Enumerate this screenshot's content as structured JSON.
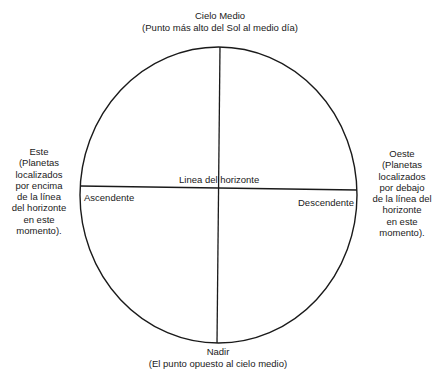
{
  "diagram": {
    "top": {
      "title": "Cielo Medio",
      "subtitle": "(Punto más alto del Sol al medio día)"
    },
    "bottom": {
      "title": "Nadir",
      "subtitle": "(El punto opuesto al cielo medio)"
    },
    "left": {
      "lines": [
        "Este",
        "(Planetas",
        "localizados",
        "por encima",
        "de la línea",
        "del horizonte",
        "en este",
        "momento)."
      ]
    },
    "right": {
      "lines": [
        "Oeste",
        "(Planetas",
        "localizados",
        "por debajo",
        "de la línea del",
        "horizonte",
        "en este",
        "momento)."
      ]
    },
    "horizon_label": "Linea del horizonte",
    "ascendant_label": "Ascendente",
    "descendant_label": "Descendente",
    "colors": {
      "line": "#1a1a1a",
      "background": "#ffffff"
    }
  }
}
